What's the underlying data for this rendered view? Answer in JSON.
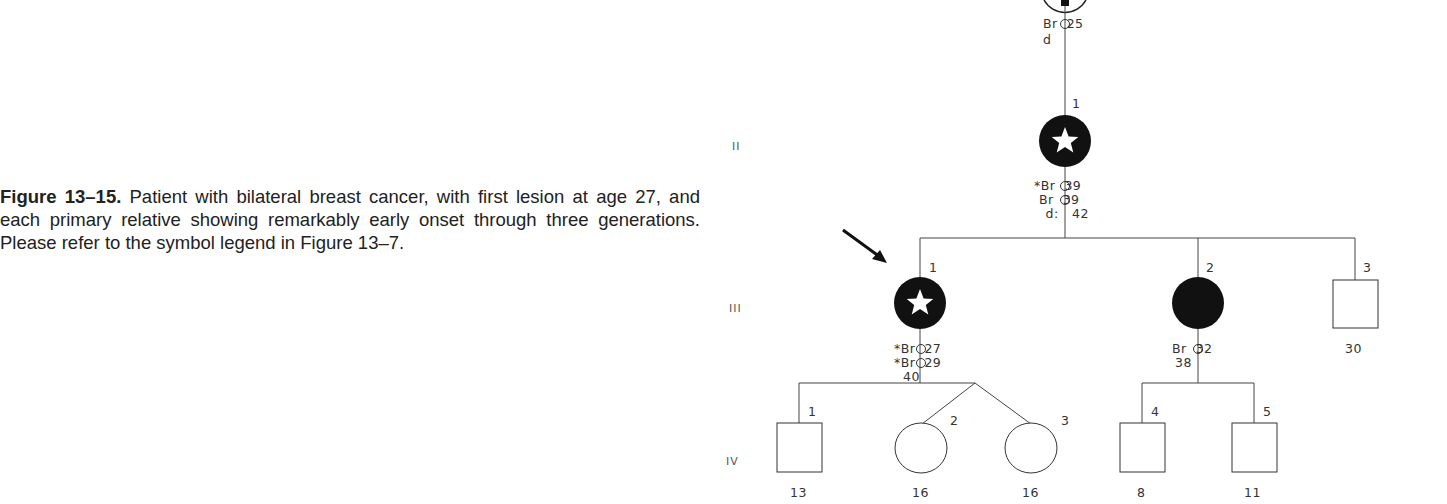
{
  "caption": {
    "label": "Figure 13–15.",
    "text": " Patient with bilateral breast cancer, with first lesion at age 27, and each primary relative showing remarkably early onset through three generations. Please refer to the symbol legend in Figure 13–7."
  },
  "generations": [
    "II",
    "III",
    "IV"
  ],
  "pedigree": {
    "gen_I": {
      "label1": "Br  25",
      "label2": "d"
    },
    "gen_II": [
      {
        "num": "1",
        "sex": "female",
        "affected": true,
        "star": true,
        "labels": [
          "*Br  39",
          " Br  39",
          " d:   42"
        ]
      }
    ],
    "gen_III": [
      {
        "num": "1",
        "sex": "female",
        "affected": true,
        "star": true,
        "proband": true,
        "labels": [
          "*Br  27",
          "*Br  29",
          "40"
        ]
      },
      {
        "num": "2",
        "sex": "female",
        "affected": true,
        "star": false,
        "labels": [
          "Br  32",
          "38"
        ]
      },
      {
        "num": "3",
        "sex": "male",
        "affected": false,
        "labels": [
          "30"
        ]
      }
    ],
    "gen_IV": [
      {
        "num": "1",
        "sex": "male",
        "age": "13"
      },
      {
        "num": "2",
        "sex": "female",
        "age": "16"
      },
      {
        "num": "3",
        "sex": "female",
        "age": "16"
      },
      {
        "num": "4",
        "sex": "male",
        "age": "8"
      },
      {
        "num": "5",
        "sex": "male",
        "age": "11"
      }
    ]
  }
}
